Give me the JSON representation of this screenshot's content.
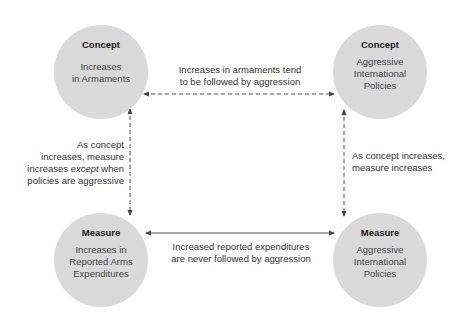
{
  "nodes": [
    {
      "id": "concept-armaments",
      "kind": "Concept",
      "label": "Increases\nin Armaments"
    },
    {
      "id": "concept-policies",
      "kind": "Concept",
      "label": "Aggressive\nInternational\nPolicies"
    },
    {
      "id": "measure-expenditures",
      "kind": "Measure",
      "label": "Increases in\nReported Arms\nExpenditures"
    },
    {
      "id": "measure-policies",
      "kind": "Measure",
      "label": "Aggressive\nInternational\nPolicies"
    }
  ],
  "edges": [
    {
      "id": "top",
      "from": "concept-armaments",
      "to": "concept-policies",
      "style": "dashed",
      "label": "Increases in armaments tend\nto be followed by aggression"
    },
    {
      "id": "bottom",
      "from": "measure-expenditures",
      "to": "measure-policies",
      "style": "solid",
      "label": "Increased reported expenditures\nare never followed by aggression"
    },
    {
      "id": "left",
      "from": "concept-armaments",
      "to": "measure-expenditures",
      "style": "dashed",
      "label_parts": [
        "As concept\nincreases, measure\nincreases ",
        "except",
        " when\npolicies are aggressive"
      ]
    },
    {
      "id": "right",
      "from": "concept-policies",
      "to": "measure-policies",
      "style": "dashed",
      "label": "As concept increases,\nmeasure increases"
    }
  ],
  "colors": {
    "node_fill": "#d9d9d9",
    "line": "#444444",
    "text": "#333333"
  }
}
